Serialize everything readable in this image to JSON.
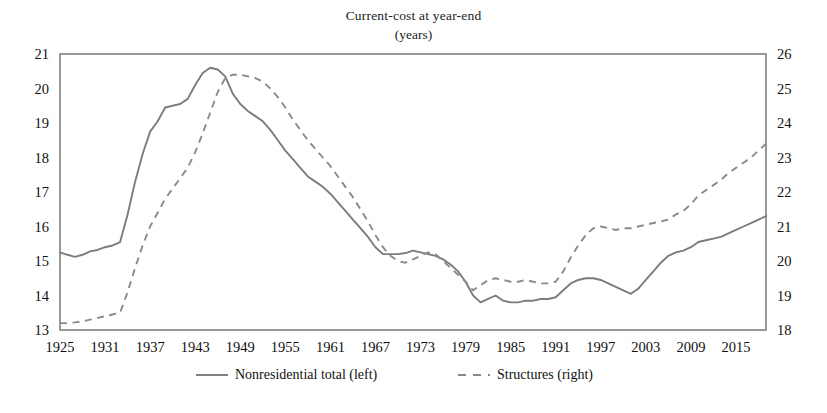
{
  "chart_data": {
    "type": "line",
    "title": "Current-cost at year-end",
    "subtitle": "(years)",
    "xlabel": "",
    "ylabel": "",
    "grid": false,
    "legend_position": "bottom",
    "xlim": [
      1925,
      2019
    ],
    "xticks": [
      1925,
      1931,
      1937,
      1943,
      1949,
      1955,
      1961,
      1967,
      1973,
      1979,
      1985,
      1991,
      1997,
      2003,
      2009,
      2015
    ],
    "left_axis": {
      "label": "Nonresidential total (left)",
      "ylim": [
        13,
        21
      ],
      "yticks": [
        13,
        14,
        15,
        16,
        17,
        18,
        19,
        20,
        21
      ]
    },
    "right_axis": {
      "label": "Structures (right)",
      "ylim": [
        18,
        26
      ],
      "yticks": [
        18,
        19,
        20,
        21,
        22,
        23,
        24,
        25,
        26
      ]
    },
    "x": [
      1925,
      1926,
      1927,
      1928,
      1929,
      1930,
      1931,
      1932,
      1933,
      1934,
      1935,
      1936,
      1937,
      1938,
      1939,
      1940,
      1941,
      1942,
      1943,
      1944,
      1945,
      1946,
      1947,
      1948,
      1949,
      1950,
      1951,
      1952,
      1953,
      1954,
      1955,
      1956,
      1957,
      1958,
      1959,
      1960,
      1961,
      1962,
      1963,
      1964,
      1965,
      1966,
      1967,
      1968,
      1969,
      1970,
      1971,
      1972,
      1973,
      1974,
      1975,
      1976,
      1977,
      1978,
      1979,
      1980,
      1981,
      1982,
      1983,
      1984,
      1985,
      1986,
      1987,
      1988,
      1989,
      1990,
      1991,
      1992,
      1993,
      1994,
      1995,
      1996,
      1997,
      1998,
      1999,
      2000,
      2001,
      2002,
      2003,
      2004,
      2005,
      2006,
      2007,
      2008,
      2009,
      2010,
      2011,
      2012,
      2013,
      2014,
      2015,
      2016,
      2017,
      2018,
      2019
    ],
    "series": [
      {
        "name": "Nonresidential total (left)",
        "axis": "left",
        "style": "solid",
        "color": "#7c7c7c",
        "values": [
          15.25,
          15.18,
          15.12,
          15.18,
          15.28,
          15.32,
          15.4,
          15.45,
          15.55,
          16.35,
          17.3,
          18.1,
          18.75,
          19.05,
          19.45,
          19.5,
          19.55,
          19.7,
          20.1,
          20.45,
          20.6,
          20.55,
          20.35,
          19.85,
          19.55,
          19.35,
          19.2,
          19.05,
          18.8,
          18.5,
          18.2,
          17.95,
          17.7,
          17.45,
          17.3,
          17.15,
          16.95,
          16.7,
          16.45,
          16.2,
          15.95,
          15.7,
          15.4,
          15.2,
          15.2,
          15.2,
          15.23,
          15.3,
          15.25,
          15.2,
          15.15,
          15.05,
          14.9,
          14.7,
          14.4,
          14.0,
          13.8,
          13.9,
          14.0,
          13.85,
          13.8,
          13.8,
          13.85,
          13.85,
          13.9,
          13.9,
          13.95,
          14.15,
          14.35,
          14.45,
          14.5,
          14.5,
          14.45,
          14.35,
          14.25,
          14.15,
          14.05,
          14.2,
          14.45,
          14.7,
          14.95,
          15.15,
          15.25,
          15.3,
          15.4,
          15.55,
          15.6,
          15.65,
          15.7,
          15.8,
          15.9,
          16.0,
          16.1,
          16.2,
          16.3
        ]
      },
      {
        "name": "Structures (right)",
        "axis": "right",
        "style": "dashed",
        "color": "#8a8a8a",
        "values": [
          18.2,
          18.2,
          18.22,
          18.25,
          18.3,
          18.35,
          18.4,
          18.45,
          18.5,
          19.1,
          19.8,
          20.45,
          21.0,
          21.4,
          21.8,
          22.1,
          22.4,
          22.7,
          23.15,
          23.7,
          24.3,
          24.9,
          25.3,
          25.4,
          25.4,
          25.35,
          25.3,
          25.2,
          25.0,
          24.75,
          24.45,
          24.1,
          23.8,
          23.5,
          23.25,
          23.0,
          22.75,
          22.45,
          22.15,
          21.85,
          21.5,
          21.15,
          20.75,
          20.4,
          20.15,
          20.0,
          19.95,
          20.05,
          20.15,
          20.25,
          20.2,
          20.0,
          19.8,
          19.6,
          19.4,
          19.15,
          19.3,
          19.45,
          19.5,
          19.45,
          19.4,
          19.4,
          19.45,
          19.4,
          19.35,
          19.35,
          19.4,
          19.7,
          20.1,
          20.45,
          20.75,
          20.95,
          21.0,
          20.95,
          20.9,
          20.95,
          20.95,
          21.0,
          21.05,
          21.1,
          21.15,
          21.2,
          21.35,
          21.45,
          21.65,
          21.9,
          22.05,
          22.2,
          22.35,
          22.55,
          22.7,
          22.85,
          23.0,
          23.2,
          23.4
        ]
      }
    ]
  },
  "legend": {
    "items": [
      {
        "label": "Nonresidential total (left)",
        "style": "solid"
      },
      {
        "label": "Structures (right)",
        "style": "dashed"
      }
    ]
  }
}
